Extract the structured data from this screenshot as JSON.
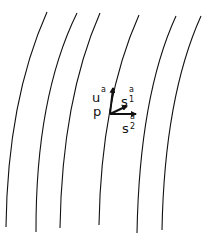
{
  "diagram": {
    "stroke_color": "#111111",
    "curves": [
      {
        "id": "curve-1",
        "top": [
          47,
          12
        ],
        "mid": [
          17,
          110
        ],
        "bottom": [
          6,
          227
        ]
      },
      {
        "id": "curve-2",
        "top": [
          77,
          13
        ],
        "mid": [
          46,
          110
        ],
        "bottom": [
          36,
          232
        ]
      },
      {
        "id": "curve-3",
        "top": [
          100,
          13
        ],
        "mid": [
          71,
          110
        ],
        "bottom": [
          60,
          228
        ]
      },
      {
        "id": "curve-4",
        "top": [
          139,
          15
        ],
        "mid": [
          110,
          110
        ],
        "bottom": [
          99,
          225
        ]
      },
      {
        "id": "curve-5",
        "top": [
          176,
          16
        ],
        "mid": [
          148,
          110
        ],
        "bottom": [
          137,
          233
        ]
      },
      {
        "id": "curve-6",
        "top": [
          201,
          16
        ],
        "mid": [
          173,
          110
        ],
        "bottom": [
          162,
          230
        ]
      }
    ],
    "point": {
      "label": "p",
      "x": 110,
      "y": 114
    },
    "vectors": [
      {
        "name": "u",
        "label": "u",
        "sup": "a",
        "sub": "",
        "to": [
          113,
          88
        ]
      },
      {
        "name": "s1",
        "label": "s",
        "sup": "a",
        "sub": "1",
        "to": [
          127,
          106
        ]
      },
      {
        "name": "s2",
        "label": "s",
        "sup": "a",
        "sub": "2",
        "to": [
          136,
          114
        ]
      }
    ]
  },
  "labels": {
    "u": {
      "main": "u",
      "sup": "a"
    },
    "p": {
      "main": "p"
    },
    "s1": {
      "main": "s",
      "sup": "a",
      "sub": "1"
    },
    "s2": {
      "main": "s",
      "sup": "a",
      "sub": "2"
    }
  }
}
